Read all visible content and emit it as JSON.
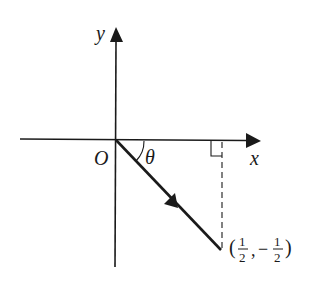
{
  "diagram": {
    "type": "vector-on-cartesian-plane",
    "axes": {
      "x_label": "x",
      "y_label": "y",
      "origin_label": "O"
    },
    "vector": {
      "from": [
        0,
        0
      ],
      "to": [
        0.5,
        -0.5
      ],
      "angle_label": "θ"
    },
    "point": {
      "label_open": "(",
      "x_num": "1",
      "x_den": "2",
      "separator": ",",
      "y_sign": "−",
      "y_num": "1",
      "y_den": "2",
      "label_close": ")"
    },
    "annotations": {
      "right_angle_marker": true,
      "dashed_projection": true
    },
    "colors": {
      "stroke": "#1a1a1a",
      "background": "#ffffff"
    }
  }
}
